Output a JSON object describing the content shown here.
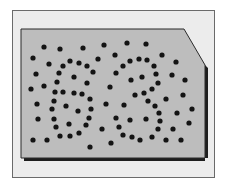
{
  "figure": {
    "hidden_number": "63",
    "colors": {
      "frame_bg": "#ececec",
      "frame_border": "#6a6a6a",
      "card_fill": "#bdbdbd",
      "card_border": "#2a2a2a",
      "shadow": "#1e1e1e",
      "dot": "#141414"
    },
    "card_polygon": "21,29 184,29 205,65 205,158 21,158",
    "shadow_polygon": "24,158 208,158 208,68 205,65 205,161 24,161",
    "dot_radius": 2.6,
    "dots": [
      [
        44,
        47
      ],
      [
        60,
        49
      ],
      [
        83,
        48
      ],
      [
        104,
        45
      ],
      [
        127,
        43
      ],
      [
        146,
        44
      ],
      [
        33,
        58
      ],
      [
        49,
        64
      ],
      [
        70,
        61
      ],
      [
        79,
        63
      ],
      [
        87,
        66
      ],
      [
        98,
        59
      ],
      [
        115,
        55
      ],
      [
        130,
        61
      ],
      [
        139,
        59
      ],
      [
        147,
        60
      ],
      [
        162,
        55
      ],
      [
        176,
        62
      ],
      [
        63,
        66
      ],
      [
        59,
        73
      ],
      [
        93,
        72
      ],
      [
        116,
        73
      ],
      [
        123,
        66
      ],
      [
        154,
        66
      ],
      [
        36,
        74
      ],
      [
        74,
        77
      ],
      [
        131,
        80
      ],
      [
        142,
        77
      ],
      [
        156,
        74
      ],
      [
        172,
        75
      ],
      [
        185,
        80
      ],
      [
        31,
        89
      ],
      [
        44,
        86
      ],
      [
        57,
        82
      ],
      [
        87,
        83
      ],
      [
        110,
        87
      ],
      [
        158,
        83
      ],
      [
        152,
        89
      ],
      [
        55,
        92
      ],
      [
        63,
        92
      ],
      [
        74,
        93
      ],
      [
        82,
        94
      ],
      [
        135,
        95
      ],
      [
        144,
        93
      ],
      [
        183,
        95
      ],
      [
        166,
        99
      ],
      [
        148,
        101
      ],
      [
        37,
        104
      ],
      [
        54,
        101
      ],
      [
        90,
        99
      ],
      [
        106,
        104
      ],
      [
        124,
        105
      ],
      [
        66,
        106
      ],
      [
        155,
        106
      ],
      [
        52,
        109
      ],
      [
        78,
        111
      ],
      [
        91,
        109
      ],
      [
        159,
        113
      ],
      [
        177,
        113
      ],
      [
        192,
        109
      ],
      [
        38,
        119
      ],
      [
        54,
        119
      ],
      [
        89,
        118
      ],
      [
        116,
        118
      ],
      [
        130,
        120
      ],
      [
        146,
        119
      ],
      [
        160,
        121
      ],
      [
        189,
        123
      ],
      [
        56,
        127
      ],
      [
        69,
        124
      ],
      [
        86,
        125
      ],
      [
        119,
        127
      ],
      [
        102,
        129
      ],
      [
        158,
        129
      ],
      [
        173,
        129
      ],
      [
        79,
        133
      ],
      [
        60,
        136
      ],
      [
        70,
        136
      ],
      [
        123,
        135
      ],
      [
        132,
        137
      ],
      [
        140,
        140
      ],
      [
        152,
        137
      ],
      [
        166,
        140
      ],
      [
        181,
        140
      ],
      [
        33,
        140
      ],
      [
        47,
        140
      ],
      [
        111,
        143
      ],
      [
        90,
        147
      ]
    ]
  }
}
